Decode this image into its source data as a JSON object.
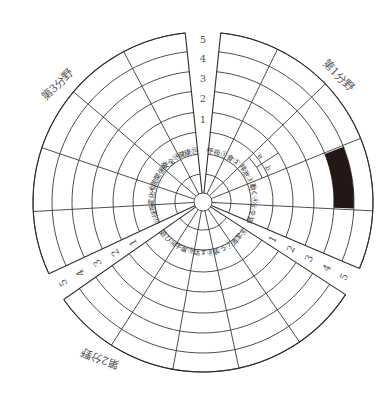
{
  "chart_data": {
    "type": "radial-segmented-grid",
    "title": "",
    "center": [
      203,
      202
    ],
    "hub_radius": 9,
    "label_rings": [
      28,
      48,
      70
    ],
    "scale_rings": [
      90,
      111,
      131,
      151,
      170
    ],
    "scale_ticks": [
      "1",
      "2",
      "3",
      "4",
      "5"
    ],
    "sectors": [
      {
        "name": "第1分野",
        "start_deg": -84,
        "end_deg": 23,
        "title_pos": [
          338,
          76
        ],
        "title_rotate": 45,
        "spokes": [
          -84,
          -64,
          -44,
          -22,
          3,
          23
        ],
        "categories": [
          {
            "num": "①",
            "label": "呼吸"
          },
          {
            "num": "②",
            "label": "食"
          },
          {
            "num": "③",
            "label": "排泄",
            "sub": [
              "a",
              "b"
            ]
          },
          {
            "num": "④",
            "label": "動く"
          },
          {
            "num": "⑤",
            "label": "眠る"
          }
        ]
      },
      {
        "name": "第2分野",
        "start_deg": 33,
        "end_deg": 145,
        "title_pos": [
          100,
          358
        ],
        "title_rotate": 200,
        "spokes": [
          33,
          55.4,
          77.8,
          100.2,
          122.6,
          145
        ],
        "categories": [
          {
            "num": "⑥",
            "label": "清潔"
          },
          {
            "num": "⑦",
            "label": "装う"
          },
          {
            "num": "⑧",
            "label": "話す"
          },
          {
            "num": "⑨",
            "label": "学習"
          },
          {
            "num": "⑩",
            "label": "遊び"
          }
        ]
      },
      {
        "name": "第3分野",
        "start_deg": 155,
        "end_deg": 264,
        "title_pos": [
          58,
          85
        ],
        "title_rotate": -45,
        "spokes": [
          155,
          176.8,
          198.6,
          220.4,
          242.2,
          264
        ],
        "categories": [
          {
            "num": "⑪",
            "label": "役割"
          },
          {
            "num": "⑫",
            "label": "変化"
          },
          {
            "num": "⑬",
            "label": "人間関係"
          },
          {
            "num": "⑭",
            "label": "安全"
          },
          {
            "num": "⑮",
            "label": "健康"
          }
        ]
      }
    ],
    "filled_cells": [
      {
        "sector": "第1分野",
        "category": "④",
        "level": 4,
        "color": "#231815"
      }
    ],
    "scale_label_positions": {
      "top_gap": {
        "angle_deg": -90
      },
      "right_gap": {
        "angle_deg": 28
      },
      "left_gap": {
        "angle_deg": 150
      }
    }
  }
}
